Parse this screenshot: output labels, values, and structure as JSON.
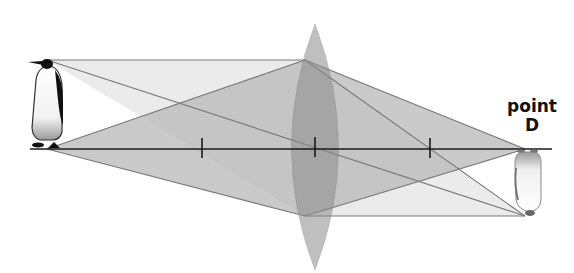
{
  "diagram": {
    "type": "thin convex lens ray diagram",
    "label_point": "point",
    "label_letter": "D",
    "object": "penguin (upright)",
    "image": "penguin (inverted, real)",
    "focal_ticks": 3,
    "colors": {
      "light_ray_fill": "#e6e6e6",
      "dark_ray_fill": "#bdbdbd",
      "lens_fill": "#9a9a9a",
      "axis": "#1a1a1a",
      "ray_line": "#7a7a7a"
    }
  }
}
